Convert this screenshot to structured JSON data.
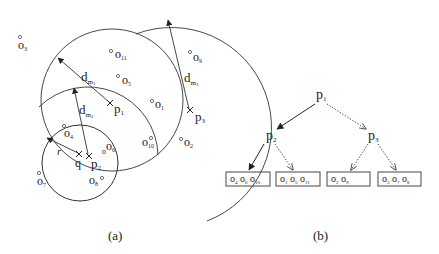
{
  "figure_a": {
    "caption": "(a)",
    "pivots": [
      {
        "id": "p1",
        "label": "p",
        "sub": "1",
        "x": 110,
        "y": 103
      },
      {
        "id": "p2",
        "label": "p",
        "sub": "2",
        "x": 89,
        "y": 156
      },
      {
        "id": "p3",
        "label": "p",
        "sub": "3",
        "x": 190,
        "y": 110
      }
    ],
    "query": {
      "label": "q",
      "x": 79,
      "y": 154,
      "radius_label": "r"
    },
    "distance_labels": [
      {
        "id": "dm1",
        "label": "d",
        "sub": "m",
        "subsub": "1"
      },
      {
        "id": "dm2",
        "label": "d",
        "sub": "m",
        "subsub": "2"
      },
      {
        "id": "dm3",
        "label": "d",
        "sub": "m",
        "subsub": "3"
      }
    ],
    "objects": [
      {
        "label": "o",
        "sub": "1"
      },
      {
        "label": "o",
        "sub": "2"
      },
      {
        "label": "o",
        "sub": "3"
      },
      {
        "label": "o",
        "sub": "4"
      },
      {
        "label": "o",
        "sub": "5"
      },
      {
        "label": "o",
        "sub": "6"
      },
      {
        "label": "o",
        "sub": "7"
      },
      {
        "label": "o",
        "sub": "8"
      },
      {
        "label": "o",
        "sub": "9"
      },
      {
        "label": "o",
        "sub": "10"
      },
      {
        "label": "o",
        "sub": "11"
      }
    ]
  },
  "figure_b": {
    "caption": "(b)",
    "root": {
      "label": "p",
      "sub": "1"
    },
    "children": [
      {
        "label": "p",
        "sub": "2",
        "edge": "solid"
      },
      {
        "label": "p",
        "sub": "3",
        "edge": "dotted"
      }
    ],
    "leaves": [
      {
        "parent": "p2",
        "edge": "solid",
        "items": [
          [
            "o",
            "4"
          ],
          [
            "o",
            "6"
          ],
          [
            "o",
            "10"
          ]
        ]
      },
      {
        "parent": "p2",
        "edge": "dotted",
        "items": [
          [
            "o",
            "1"
          ],
          [
            "o",
            "5"
          ],
          [
            "o",
            "11"
          ]
        ]
      },
      {
        "parent": "p3",
        "edge": "dotted",
        "items": [
          [
            "o",
            "2"
          ],
          [
            "o",
            "9"
          ]
        ]
      },
      {
        "parent": "p3",
        "edge": "dotted",
        "items": [
          [
            "o",
            "3"
          ],
          [
            "o",
            "7"
          ],
          [
            "o",
            "8"
          ]
        ]
      }
    ]
  }
}
